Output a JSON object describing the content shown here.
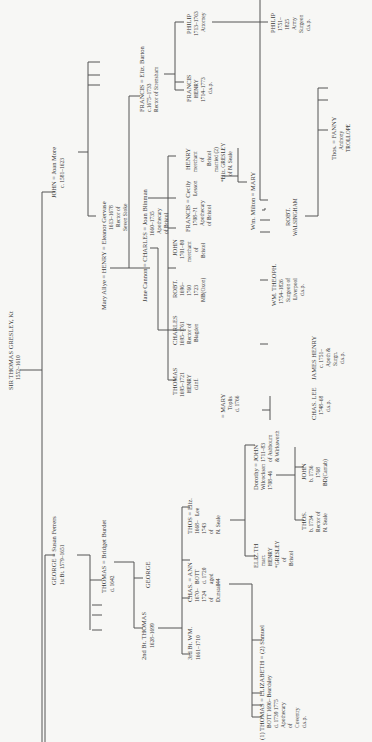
{
  "colors": {
    "background": "#f7f7f5",
    "ink": "#3a3a3a",
    "line": "#555555"
  },
  "nodes": {
    "root": {
      "name": "SIR THOMAS GRESLEY, Kt",
      "dates": "1552–1610"
    },
    "george": {
      "name": "GEORGE = Susan Ferrers",
      "detail": "1st Bt. 1579–1651"
    },
    "thomas_bridget": {
      "name": "THOMAS = Bridget Burdet",
      "detail": "d. 1642"
    },
    "george2": {
      "name": "GEORGE"
    },
    "thomas_2bt": {
      "name": "2nd Bt. THOMAS",
      "detail": "1628–1699"
    },
    "wm_3bt": {
      "name": "3rd Bt. WM.",
      "detail": "1661–1710"
    },
    "chas_ann": {
      "name": "CHAS. = ANN",
      "left": [
        "1670–",
        "1724",
        "of",
        "Dunstall"
      ],
      "right": [
        "BOTT",
        "d. 1720",
        "aged",
        "44"
      ]
    },
    "thos_eliz": {
      "name": "THOS = Eliz.",
      "left": [
        "1668–",
        "1743",
        "of",
        "N. Seale"
      ],
      "right": [
        "Lee"
      ]
    },
    "thomas_elizabeth": {
      "name": "(1) THOMAS = ELIZABETH = (2) Samuel",
      "lines": [
        "BOTT     1696–      Beardsley",
        "d. 1739   1775",
        "Apothecary",
        "of",
        "Coventry",
        "d.s.p."
      ]
    },
    "eliz_henry": {
      "name": "ELIZ.TH",
      "lines": [
        "marr.",
        "HENRY",
        "*GRESLEY",
        "of",
        "Bristol"
      ]
    },
    "dorothy_john": {
      "name": "Dorothy = JOHN",
      "left": [
        "Wilcockson",
        "1708–46"
      ],
      "right": [
        "1711–83",
        "of Ashbourn",
        "& Wirksworth"
      ]
    },
    "thos_1734": {
      "name": "THOS.",
      "lines": [
        "b. 1734",
        "Rector of",
        "N. Seale"
      ]
    },
    "john_1736": {
      "name": "JOHN",
      "lines": [
        "b. 1736",
        "1768",
        "BD(Cantab)"
      ]
    },
    "john_more": {
      "name": "JOHN = Joan More",
      "detail": "c. 1581–1623"
    },
    "henry": {
      "name": "Mary Allye = HENRY = Eleanor Gervase",
      "lines": [
        "1613–1678",
        "Rector of",
        "Seven Stoke"
      ]
    },
    "charles": {
      "name": "Jane Cannon = CHARLES = Joan Blinman",
      "lines": [
        "1660–1735",
        "Apothecary",
        "of Bristol"
      ]
    },
    "francis_eliz": {
      "name": "FRANCIS = Eliz. Barton",
      "lines": [
        "c.1675–1733",
        "Rector of Strensham"
      ]
    },
    "philip_1713": {
      "name": "PHILIP",
      "lines": [
        "1713–1763",
        "Attorney"
      ]
    },
    "francis_henry": {
      "name": "FRANCIS",
      "lines": [
        "HENRY",
        "1714–1773",
        "d.s.p."
      ]
    },
    "philip_1751": {
      "name": "PHILIP",
      "lines": [
        "1751–",
        "1825",
        "Army",
        "Surgeon",
        "d.s.p."
      ]
    },
    "thomas_1695": {
      "name": "THOMAS",
      "lines": [
        "1695–1721",
        "HENRY",
        "d.inf."
      ]
    },
    "charles_1695": {
      "name": "CHARLES",
      "lines": [
        "1695–1761",
        "Rector of",
        "Blagden"
      ]
    },
    "robt_1696": {
      "name": "ROBT.",
      "lines": [
        "1696–",
        "1760",
        "1723",
        "MB(Oxon)"
      ]
    },
    "john_1701": {
      "name": "JOHN",
      "lines": [
        "1701–80",
        "merchant",
        "of",
        "Bristol"
      ]
    },
    "francis_cecily": {
      "name": "FRANCIS = Cecily",
      "lines": [
        "1708–?1",
        "Apothecary",
        "of Bristol"
      ],
      "right": [
        "Lesson"
      ]
    },
    "henry_merchant": {
      "name": "HENRY",
      "lines": [
        "merchant",
        "of",
        "Bristol",
        "married (2)",
        "*Eliz. GRESLEY",
        "of N. Seale"
      ]
    },
    "milton_mary": {
      "name": "Wm. Milton = MARY"
    },
    "mary_toplis": {
      "name": "= MARY",
      "lines": [
        "Toplis",
        "d. 1766"
      ]
    },
    "chas_lee": {
      "name": "CHAS. LEE",
      "lines": [
        "1748–68",
        "d.s.p."
      ]
    },
    "james_henry": {
      "name": "JAMES HENRY",
      "lines": [
        "c. 1751–",
        "Apoth &",
        "Surgn.",
        "d.s.p."
      ]
    },
    "wm_theoph": {
      "name": "WM. THEOPH.",
      "lines": [
        "1754–1826",
        "Surgeon of",
        "Liverpool",
        "d.s.p."
      ]
    },
    "robt_walsingham": {
      "name": "ROBT.",
      "lines": [
        "WALSINGHAM"
      ]
    },
    "thos_fanny": {
      "name": "Thos. = FANNY",
      "lines": [
        "Anthony",
        "TROLLOPE"
      ]
    }
  }
}
